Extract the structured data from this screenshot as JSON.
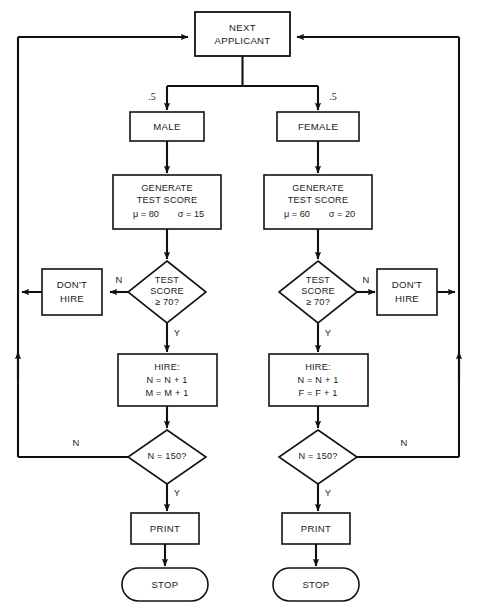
{
  "diagram": {
    "type": "flowchart",
    "background_color": "#ffffff",
    "line_color": "#111111",
    "shape_fill": "#ffffff"
  },
  "nodes": {
    "start": {
      "id": "next-applicant",
      "shape": "rectangle",
      "line1": "NEXT",
      "line2": "APPLICANT"
    },
    "branch_labels": {
      "left": ".5",
      "right": ".5"
    },
    "left": {
      "gender": {
        "id": "male",
        "shape": "rectangle",
        "label": "MALE"
      },
      "generate": {
        "id": "generate-test-score-male",
        "shape": "rectangle",
        "line1": "GENERATE",
        "line2": "TEST SCORE",
        "mu": "μ = 80",
        "sigma": "σ = 15"
      },
      "decision_score": {
        "id": "test-score-decision-male",
        "shape": "diamond",
        "line1": "TEST",
        "line2": "SCORE",
        "line3": "≥ 70?",
        "no_label": "N",
        "yes_label": "Y"
      },
      "dont_hire": {
        "id": "dont-hire-male",
        "shape": "rectangle",
        "line1": "DON'T",
        "line2": "HIRE"
      },
      "hire": {
        "id": "hire-male",
        "shape": "rectangle",
        "line1": "HIRE:",
        "line2": "N = N + 1",
        "line3": "M = M + 1"
      },
      "decision_count": {
        "id": "count-decision-male",
        "shape": "diamond",
        "label": "N = 150?",
        "no_label": "N",
        "yes_label": "Y"
      },
      "print": {
        "id": "print-male",
        "shape": "rectangle",
        "label": "PRINT"
      },
      "stop": {
        "id": "stop-male",
        "shape": "stadium",
        "label": "STOP"
      }
    },
    "right": {
      "gender": {
        "id": "female",
        "shape": "rectangle",
        "label": "FEMALE"
      },
      "generate": {
        "id": "generate-test-score-female",
        "shape": "rectangle",
        "line1": "GENERATE",
        "line2": "TEST SCORE",
        "mu": "μ = 60",
        "sigma": "σ = 20"
      },
      "decision_score": {
        "id": "test-score-decision-female",
        "shape": "diamond",
        "line1": "TEST",
        "line2": "SCORE",
        "line3": "≥ 70?",
        "no_label": "N",
        "yes_label": "Y"
      },
      "dont_hire": {
        "id": "dont-hire-female",
        "shape": "rectangle",
        "line1": "DON'T",
        "line2": "HIRE"
      },
      "hire": {
        "id": "hire-female",
        "shape": "rectangle",
        "line1": "HIRE:",
        "line2": "N = N + 1",
        "line3": "F = F + 1"
      },
      "decision_count": {
        "id": "count-decision-female",
        "shape": "diamond",
        "label": "N = 150?",
        "no_label": "N",
        "yes_label": "Y"
      },
      "print": {
        "id": "print-female",
        "shape": "rectangle",
        "label": "PRINT"
      },
      "stop": {
        "id": "stop-female",
        "shape": "stadium",
        "label": "STOP"
      }
    }
  }
}
